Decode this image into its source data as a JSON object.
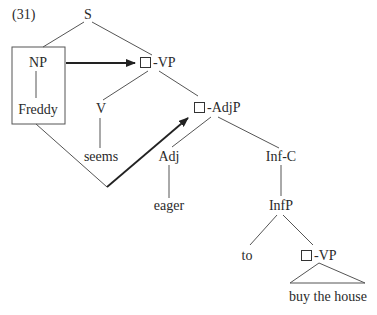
{
  "example_number": "(31)",
  "nodes": {
    "s": "S",
    "np": "NP",
    "freddy": "Freddy",
    "vp": "-VP",
    "v": "V",
    "seems": "seems",
    "adjp": "-AdjP",
    "adj": "Adj",
    "eager": "eager",
    "infc": "Inf-C",
    "infp": "InfP",
    "to": "to",
    "vp2": "-VP",
    "buy_the_house": "buy the house"
  },
  "colors": {
    "line": "#555555",
    "arrow": "#222222",
    "text": "#2a2a2a"
  }
}
